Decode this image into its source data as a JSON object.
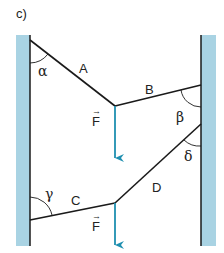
{
  "figure": {
    "label": "c)",
    "colors": {
      "wall": "#a9d3e3",
      "line": "#1a1a1a",
      "arrow": "#1f8fb0"
    },
    "upper_system": {
      "rope_A": "A",
      "rope_B": "B",
      "angle_left": "α",
      "angle_right": "β",
      "force": "F",
      "force_arrow": "→"
    },
    "lower_system": {
      "rope_C": "C",
      "rope_D": "D",
      "angle_left": "γ",
      "angle_right": "δ",
      "force": "F",
      "force_arrow": "→"
    }
  }
}
